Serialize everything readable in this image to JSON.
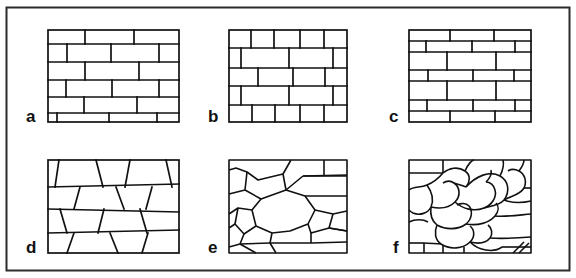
{
  "figure": {
    "border_color": "#2b2b2b",
    "line_color": "#111111",
    "background_color": "#ffffff",
    "width": 576,
    "height": 278
  },
  "panels": [
    {
      "id": "panel-a",
      "label": "a",
      "label_x": 31,
      "label_y": 122,
      "pattern": "running-bond-regular-brick",
      "frame": {
        "x": 48,
        "y": 30,
        "w": 131,
        "h": 92
      }
    },
    {
      "id": "panel-b",
      "label": "b",
      "label_x": 213,
      "label_y": 122,
      "pattern": "common-bond-mixed-header-stretcher",
      "frame": {
        "x": 229,
        "y": 30,
        "w": 118,
        "h": 92
      }
    },
    {
      "id": "panel-c",
      "label": "c",
      "label_x": 393,
      "label_y": 122,
      "pattern": "alternating-thin-thick-courses",
      "frame": {
        "x": 409,
        "y": 30,
        "w": 122,
        "h": 92
      }
    },
    {
      "id": "panel-d",
      "label": "d",
      "label_x": 31,
      "label_y": 253,
      "pattern": "coursed-squared-rubble-slanted-joints",
      "frame": {
        "x": 48,
        "y": 160,
        "w": 131,
        "h": 93
      }
    },
    {
      "id": "panel-e",
      "label": "e",
      "label_x": 213,
      "label_y": 253,
      "pattern": "polygonal-random-rubble",
      "frame": {
        "x": 229,
        "y": 160,
        "w": 118,
        "h": 93
      }
    },
    {
      "id": "panel-f",
      "label": "f",
      "label_x": 396,
      "label_y": 253,
      "pattern": "rounded-cobble-rubble",
      "frame": {
        "x": 409,
        "y": 160,
        "w": 122,
        "h": 93
      }
    }
  ],
  "outer_frame": {
    "x": 6,
    "y": 7,
    "w": 564,
    "h": 264
  }
}
